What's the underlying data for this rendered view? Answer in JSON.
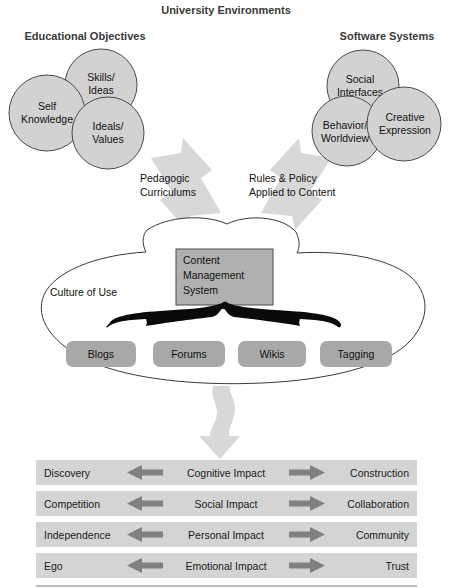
{
  "title": "University Environments",
  "left_group": {
    "heading": "Educational Objectives",
    "circles": [
      {
        "name": "skills-ideas",
        "lines": [
          "Skills/",
          "Ideas"
        ],
        "cx": 101,
        "cy": 85,
        "r": 36
      },
      {
        "name": "self-knowledge",
        "lines": [
          "Self",
          "Knowledge"
        ],
        "cx": 47,
        "cy": 113,
        "r": 38
      },
      {
        "name": "ideals-values",
        "lines": [
          "Ideals/",
          "Values"
        ],
        "cx": 108,
        "cy": 133,
        "r": 36
      }
    ]
  },
  "right_group": {
    "heading": "Software Systems",
    "circles": [
      {
        "name": "social-interfaces",
        "lines": [
          "Social",
          "Interfaces"
        ],
        "cx": 363,
        "cy": 86,
        "r": 36
      },
      {
        "name": "behavior-worldview",
        "lines": [
          "Behavior/",
          "Worldview"
        ],
        "cx": 347,
        "cy": 131,
        "r": 35
      },
      {
        "name": "creative-expression",
        "lines": [
          "Creative",
          "Expression"
        ],
        "cx": 404,
        "cy": 124,
        "r": 37
      }
    ]
  },
  "flow_arrows": [
    {
      "name": "pedagogic-curriculums",
      "lines": [
        "Pedagogic",
        "Curriculums"
      ],
      "label_x": 140,
      "label_y": 182
    },
    {
      "name": "rules-policy",
      "lines": [
        "Rules & Policy",
        "Applied to Content"
      ],
      "label_x": 249,
      "label_y": 182
    }
  ],
  "cloud": {
    "label": "Culture of Use",
    "cms": {
      "lines": [
        "Content",
        "Management",
        "System"
      ]
    },
    "pills": [
      {
        "label": "Blogs",
        "x": 66,
        "y": 341,
        "w": 70,
        "h": 26
      },
      {
        "label": "Forums",
        "x": 153,
        "y": 341,
        "w": 72,
        "h": 26
      },
      {
        "label": "Wikis",
        "x": 238,
        "y": 341,
        "w": 68,
        "h": 26
      },
      {
        "label": "Tagging",
        "x": 320,
        "y": 341,
        "w": 72,
        "h": 26
      }
    ]
  },
  "impact_rows": [
    {
      "left": "Discovery",
      "center": "Cognitive Impact",
      "right": "Construction"
    },
    {
      "left": "Competition",
      "center": "Social Impact",
      "right": "Collaboration"
    },
    {
      "left": "Independence",
      "center": "Personal Impact",
      "right": "Community"
    },
    {
      "left": "Ego",
      "center": "Emotional Impact",
      "right": "Trust"
    }
  ],
  "colors": {
    "circle_fill": "#d2d2d2",
    "circle_stroke": "#4a4a4a",
    "block_arrow": "#d8d8d8",
    "cms_fill": "#b0b0b0",
    "pill_fill": "#a8a8a8",
    "row_band": "#d4d4d4",
    "row_arrow": "#808080",
    "text": "#111111",
    "heading": "#3a3a3a"
  }
}
